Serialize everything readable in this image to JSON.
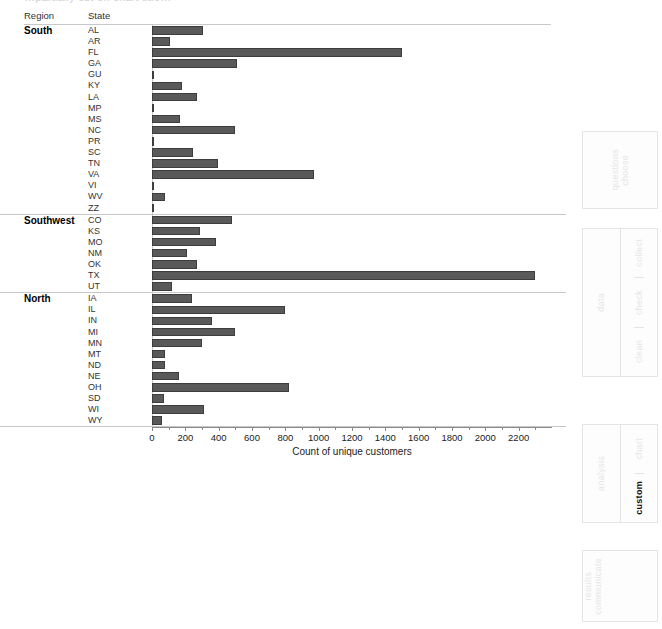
{
  "title_partial": "…partially cut-off chart title…",
  "table_headers": {
    "region": "Region",
    "state": "State"
  },
  "axis": {
    "label": "Count of unique customers",
    "min": 0,
    "max": 2400,
    "tick_step": 200,
    "ticks": [
      0,
      200,
      400,
      600,
      800,
      1000,
      1200,
      1400,
      1600,
      1800,
      2000,
      2200
    ]
  },
  "process_panel": {
    "boxes": [
      {
        "name": "choose-questions",
        "labels": [
          "questions",
          "choose"
        ],
        "active": null
      },
      {
        "name": "data",
        "main": "data",
        "steps": [
          "collect",
          "check",
          "clean"
        ],
        "active": null
      },
      {
        "name": "analysis",
        "main": "analysis",
        "steps": [
          "chart",
          "custom"
        ],
        "active": "custom"
      },
      {
        "name": "communicate-results",
        "labels": [
          "results",
          "communicate"
        ],
        "active": null
      }
    ]
  },
  "chart_data": {
    "type": "bar",
    "orientation": "horizontal",
    "title": "",
    "xlabel": "Count of unique customers",
    "ylabel": "",
    "xlim": [
      0,
      2400
    ],
    "grid": false,
    "legend": null,
    "bar_color": "#595959",
    "groups": [
      {
        "region": "South",
        "categories": [
          "AL",
          "AR",
          "FL",
          "GA",
          "GU",
          "KY",
          "LA",
          "MP",
          "MS",
          "NC",
          "PR",
          "SC",
          "TN",
          "VA",
          "VI",
          "WV",
          "ZZ"
        ],
        "values": [
          305,
          110,
          1500,
          510,
          5,
          180,
          270,
          5,
          170,
          500,
          12,
          245,
          395,
          970,
          5,
          75,
          4
        ]
      },
      {
        "region": "Southwest",
        "categories": [
          "CO",
          "KS",
          "MO",
          "NM",
          "OK",
          "TX",
          "UT"
        ],
        "values": [
          480,
          285,
          385,
          210,
          270,
          2300,
          120
        ]
      },
      {
        "region": "North",
        "categories": [
          "IA",
          "IL",
          "IN",
          "MI",
          "MN",
          "MT",
          "ND",
          "NE",
          "OH",
          "SD",
          "WI",
          "WY"
        ],
        "values": [
          240,
          795,
          360,
          500,
          300,
          80,
          75,
          160,
          820,
          70,
          310,
          60
        ]
      }
    ]
  }
}
